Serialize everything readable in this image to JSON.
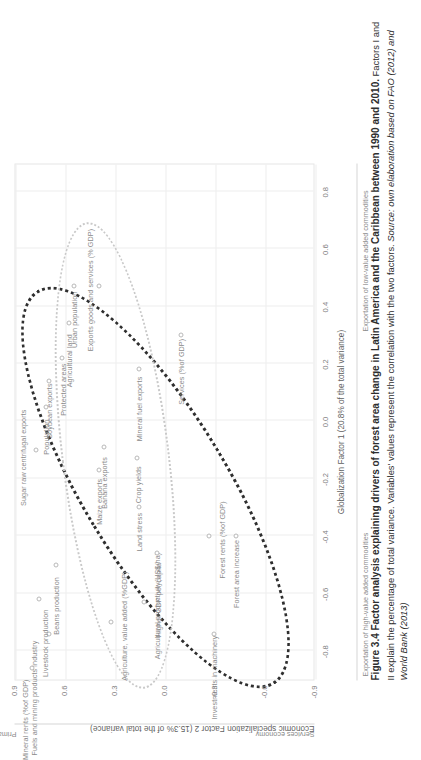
{
  "figure": {
    "number": "Figure 3.4",
    "title_bold": "Figure 3.4 Factor analysis explaining drivers of forest area change in Latin America and the Caribbean between 1990 and 2010.",
    "body": " Factors I and II explain the percentage of total variance. Variables' values represent the correlation with the two factors. ",
    "source": "Source: own elaboration based on FAO (2012) and World Bank (2013)"
  },
  "chart_data": {
    "type": "scatter",
    "title": "",
    "xlabel": "Globalization Factor 1 (20.8% of the total variance)",
    "ylabel": "Economic  specialization Factor 2 (15.3% of the total variance)",
    "xlim": [
      -0.9,
      0.9
    ],
    "ylim": [
      -0.9,
      0.9
    ],
    "xticks": [
      "-0.8",
      "-0.6",
      "-0.4",
      "-0.2",
      "0.0",
      "0.2",
      "0.4",
      "0.6",
      "0.8"
    ],
    "xtickvals": [
      -0.8,
      -0.6,
      -0.4,
      -0.2,
      0.0,
      0.2,
      0.4,
      0.6,
      0.8
    ],
    "yticks": [
      "0.9",
      "0.6",
      "0.3",
      "0.0",
      "-0.3",
      "-0.6",
      "-0.9"
    ],
    "ytickvals": [
      0.9,
      0.6,
      0.3,
      0.0,
      -0.3,
      -0.6,
      -0.9
    ],
    "grid": true,
    "legend": "none",
    "axis_poles": {
      "x_low": "Exportation of high-value added commodities",
      "x_high": "Exportation of low-value added commodities",
      "y_high": "Primary economy",
      "y_low": "Services economy"
    },
    "points": [
      {
        "label": "Mineral rents (%of GDP)",
        "x": -0.86,
        "y": 0.8
      },
      {
        "label": "Fuels and mining products industry",
        "x": -0.74,
        "y": 0.7
      },
      {
        "label": "Livestock production",
        "x": -0.62,
        "y": 0.76
      },
      {
        "label": "Beans production",
        "x": -0.5,
        "y": 0.66
      },
      {
        "label": "Agriculture, value added (%GDP)",
        "x": -0.7,
        "y": 0.33
      },
      {
        "label": "Agricultural productivity(US$/ha)",
        "x": -0.63,
        "y": 0.13
      },
      {
        "label": "Sugar raw centrifugal exports",
        "x": -0.1,
        "y": 0.78
      },
      {
        "label": "Population",
        "x": 0.05,
        "y": 0.72
      },
      {
        "label": "Soybean exports",
        "x": 0.14,
        "y": 0.7
      },
      {
        "label": "Protected areas",
        "x": 0.22,
        "y": 0.62
      },
      {
        "label": "Agricultural land",
        "x": 0.34,
        "y": 0.58
      },
      {
        "label": "Urban population",
        "x": 0.47,
        "y": 0.55
      },
      {
        "label": "Exports goods and services (% GDP)",
        "x": 0.47,
        "y": 0.4
      },
      {
        "label": "Maize exports",
        "x": -0.17,
        "y": 0.4
      },
      {
        "label": "Banana exports",
        "x": -0.09,
        "y": 0.37
      },
      {
        "label": "Land stress",
        "x": -0.3,
        "y": 0.16
      },
      {
        "label": "Crop yields",
        "x": -0.13,
        "y": 0.17
      },
      {
        "label": "Higher GDP per capita",
        "x": -0.46,
        "y": 0.05
      },
      {
        "label": "Mineral fuel exports",
        "x": 0.18,
        "y": 0.16
      },
      {
        "label": "Services (%of GDP)",
        "x": 0.3,
        "y": -0.09
      },
      {
        "label": "Forest rents (%of GDP)",
        "x": -0.4,
        "y": -0.26
      },
      {
        "label": "Forest area increase",
        "x": -0.4,
        "y": -0.42
      },
      {
        "label": "Investments in machinery",
        "x": -0.74,
        "y": -0.29
      }
    ],
    "ellipses": [
      {
        "name": "dark-cluster-ellipse",
        "style": "dotted-dark",
        "note": "large tilted ellipse spanning from upper-centre to lower-left"
      },
      {
        "name": "light-cluster-ellipse",
        "style": "dotted-light",
        "note": "shallow wide ellipse across the centre-left"
      }
    ]
  }
}
